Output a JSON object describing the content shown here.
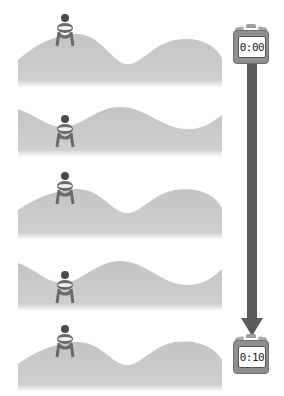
{
  "diagram": {
    "type": "time-sequence",
    "frames": [
      {
        "index": 1,
        "figure_position": "crest",
        "wave_phase": 0
      },
      {
        "index": 2,
        "figure_position": "trough",
        "wave_phase": 1
      },
      {
        "index": 3,
        "figure_position": "crest",
        "wave_phase": 0
      },
      {
        "index": 4,
        "figure_position": "trough",
        "wave_phase": 1
      },
      {
        "index": 5,
        "figure_position": "crest",
        "wave_phase": 0
      }
    ],
    "timer_start": {
      "label": "0:00",
      "icon": "stopwatch-icon"
    },
    "timer_end": {
      "label": "0:10",
      "icon": "stopwatch-icon"
    },
    "arrow": {
      "direction": "down",
      "meaning": "time elapsed"
    },
    "colors": {
      "wave": "#c8c8c8",
      "arrow": "#5a5a5a",
      "figure": "#5c5c5c",
      "stopwatch": "#8f8f8f"
    }
  }
}
